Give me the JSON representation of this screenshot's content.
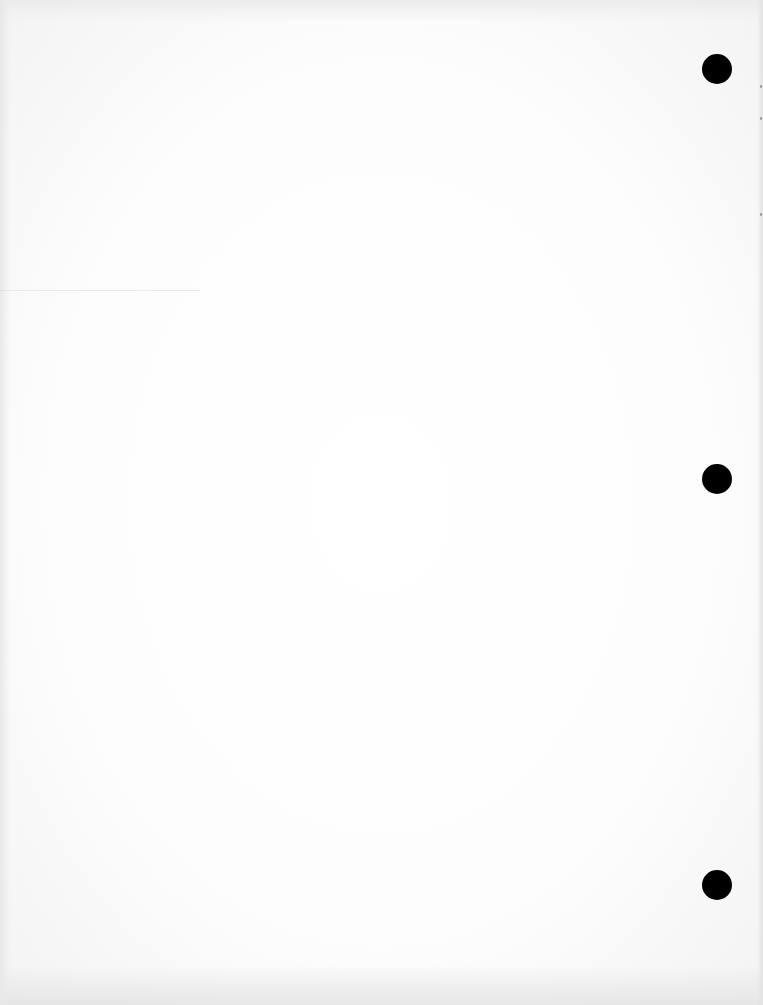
{
  "document": {
    "type": "blank scanned page",
    "text": "",
    "background_color": "#fdfdfd",
    "punch_holes": [
      {
        "cx": 717,
        "cy": 69,
        "diameter": 30,
        "color": "#000000"
      },
      {
        "cx": 717,
        "cy": 479,
        "diameter": 30,
        "color": "#000000"
      },
      {
        "cx": 717,
        "cy": 885,
        "diameter": 30,
        "color": "#000000"
      }
    ]
  }
}
